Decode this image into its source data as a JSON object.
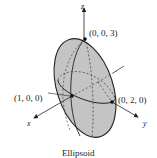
{
  "figure": {
    "caption": "Ellipsoid",
    "axes": {
      "x_label": "x",
      "y_label": "y",
      "z_label": "z"
    },
    "points": [
      {
        "id": "z-intercept",
        "label": "(0, 0, 3)"
      },
      {
        "id": "x-intercept",
        "label": "(1, 0, 0)"
      },
      {
        "id": "y-intercept",
        "label": "(0, 2, 0)"
      }
    ],
    "colors": {
      "surface": "#c4c4c4",
      "stroke": "#222222",
      "background": "#ffffff"
    }
  }
}
